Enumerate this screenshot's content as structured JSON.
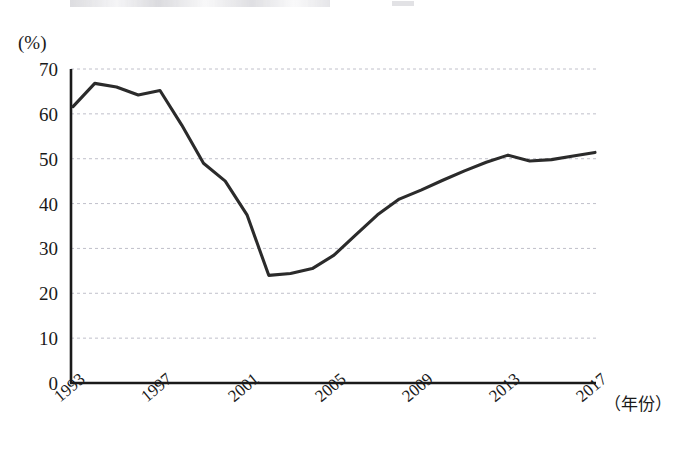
{
  "figure": {
    "background_color": "#ffffff",
    "line_color": "#2b2b2b",
    "axis_color": "#1a1a1a",
    "grid_color": "#b9b9c4",
    "x_axis_name": "（年份）",
    "y_axis_unit": "(%)"
  },
  "chart_data": {
    "type": "line",
    "title": "",
    "xlabel": "（年份）",
    "ylabel": "(%)",
    "xlim": [
      1993,
      2017
    ],
    "ylim": [
      0,
      70
    ],
    "yticks": [
      0,
      10,
      20,
      30,
      40,
      50,
      60,
      70
    ],
    "xticks": [
      1993,
      1997,
      2001,
      2005,
      2009,
      2013,
      2017
    ],
    "xtick_labels": [
      "1993",
      "1997",
      "2001",
      "2005",
      "2009",
      "2013",
      "2017"
    ],
    "ytick_labels": [
      "0",
      "10",
      "20",
      "30",
      "40",
      "50",
      "60",
      "70"
    ],
    "grid": true,
    "grid_axis": "y",
    "grid_style": "dashed",
    "legend": false,
    "x": [
      1993,
      1994,
      1995,
      1996,
      1997,
      1998,
      1999,
      2000,
      2001,
      2002,
      2003,
      2004,
      2005,
      2006,
      2007,
      2008,
      2009,
      2010,
      2011,
      2012,
      2013,
      2014,
      2015,
      2016,
      2017
    ],
    "values": [
      61.6,
      66.8,
      66.0,
      64.2,
      65.2,
      57.5,
      49.0,
      45.0,
      37.5,
      24.0,
      24.4,
      25.5,
      28.5,
      33.0,
      37.5,
      41.0,
      43.0,
      45.2,
      47.3,
      49.2,
      50.8,
      49.5,
      49.8,
      50.6,
      51.4
    ],
    "series": [
      {
        "name": "",
        "values": [
          61.6,
          66.8,
          66.0,
          64.2,
          65.2,
          57.5,
          49.0,
          45.0,
          37.5,
          24.0,
          24.4,
          25.5,
          28.5,
          33.0,
          37.5,
          41.0,
          43.0,
          45.2,
          47.3,
          49.2,
          50.8,
          49.5,
          49.8,
          50.6,
          51.4
        ]
      }
    ]
  }
}
